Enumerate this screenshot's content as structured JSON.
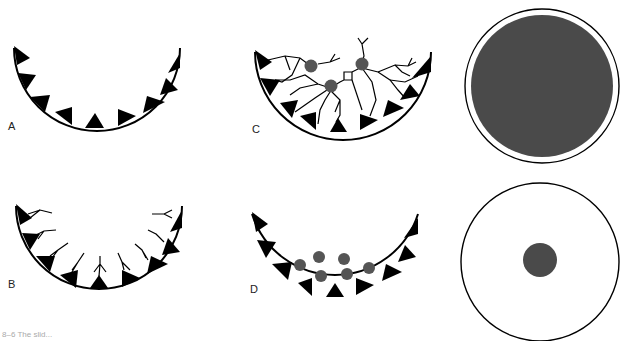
{
  "figure": {
    "panels": [
      {
        "id": "A",
        "label": "A",
        "description": "Semicircular well lined with triangular teeth"
      },
      {
        "id": "B",
        "label": "B",
        "description": "Teeth with Y-shaped branched lines attached"
      },
      {
        "id": "C",
        "label": "C",
        "description": "Branched network linking teeth with gray spheres and a square linker"
      },
      {
        "id": "D",
        "label": "D",
        "description": "Teeth with free gray spheres near the bottom"
      }
    ],
    "circles": [
      {
        "id": "top-circle",
        "description": "Circle almost completely filled with dark gray"
      },
      {
        "id": "bottom-circle",
        "description": "Circle with a small dark gray central dot"
      }
    ],
    "caption": "8–6  The slid...",
    "colors": {
      "ink": "#000000",
      "sphere": "#555555",
      "fill_dark": "#4a4a4a",
      "background": "#ffffff"
    }
  }
}
